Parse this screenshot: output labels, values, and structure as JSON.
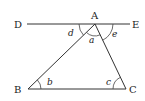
{
  "diagram": {
    "type": "geometry-triangle-with-parallel-line",
    "points": {
      "A": {
        "label": "A",
        "x": 95,
        "y": 24
      },
      "B": {
        "label": "B",
        "x": 28,
        "y": 89
      },
      "C": {
        "label": "C",
        "x": 126,
        "y": 89
      },
      "D": {
        "label": "D",
        "x": 27,
        "y": 24
      },
      "E": {
        "label": "E",
        "x": 130,
        "y": 24
      }
    },
    "segments": [
      "DE",
      "AB",
      "AC",
      "BC"
    ],
    "angles": {
      "a": {
        "label": "a",
        "vertex": "A",
        "between": "BAC"
      },
      "b": {
        "label": "b",
        "vertex": "B",
        "between": "ABC"
      },
      "c": {
        "label": "c",
        "vertex": "C",
        "between": "ACB"
      },
      "d": {
        "label": "d",
        "vertex": "A",
        "between": "DAB"
      },
      "e": {
        "label": "e",
        "vertex": "A",
        "between": "EAC"
      }
    }
  }
}
